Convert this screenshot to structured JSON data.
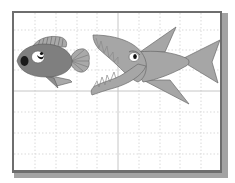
{
  "scene": {
    "description": "Clip-art illustration of a small fish being chased by a large open-mouthed shark on a grid background inside a frame",
    "style": "grayscale",
    "objects": [
      {
        "name": "small-fish",
        "position": "left",
        "facing": "left"
      },
      {
        "name": "shark",
        "position": "right",
        "facing": "left",
        "mouth": "open with sharp teeth"
      }
    ],
    "background": "white grid paper with dotted lines and two solid axis lines",
    "frame": "dark gray border with drop shadow on right and bottom"
  },
  "colors": {
    "background": "#ffffff",
    "frame": "#6e6e6e",
    "frame_shadow": "#9a9a9a",
    "grid_dotted": "#d6d6d6",
    "grid_axis": "#c4c4c4",
    "small_fish_body": "#7f7f7f",
    "small_fish_fin": "#a9a9a9",
    "shark_body": "#a6a6a6",
    "shark_outline": "#6a6a6a",
    "eye_white": "#ffffff",
    "pupil": "#111111"
  }
}
